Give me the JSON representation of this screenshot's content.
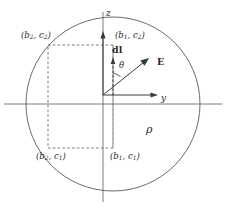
{
  "figure": {
    "type": "physics-diagram",
    "background_color": "#ffffff",
    "stroke_color": "#555555",
    "text_color": "#2a2a2a",
    "axes": {
      "vertical_label": "z",
      "horizontal_label": "y"
    },
    "vectors": {
      "field_label": "E",
      "element_label": "dl",
      "angle_label": "θ"
    },
    "region": {
      "charge_density_label": "ρ"
    },
    "corners": {
      "top_left": {
        "base": "b",
        "base_sub": "2",
        "height": "c",
        "height_sub": "2"
      },
      "top_right": {
        "base": "b",
        "base_sub": "1",
        "height": "c",
        "height_sub": "2"
      },
      "bottom_left": {
        "base": "b",
        "base_sub": "2",
        "height": "c",
        "height_sub": "1"
      },
      "bottom_right": {
        "base": "b",
        "base_sub": "1",
        "height": "c",
        "height_sub": "1"
      }
    },
    "geometry": {
      "circle_center_x": 113,
      "circle_center_y": 104,
      "circle_radius": 87,
      "origin_x": 103,
      "origin_y": 95,
      "rect_left": 48,
      "rect_right": 113,
      "rect_top": 45,
      "rect_bottom": 148
    }
  }
}
